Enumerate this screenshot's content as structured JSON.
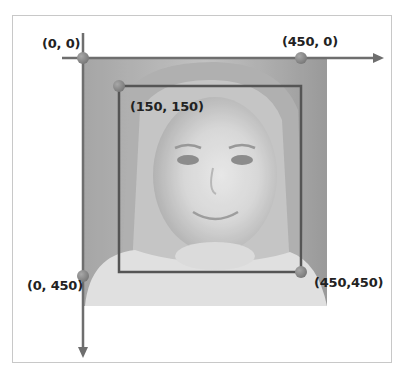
{
  "diagram": {
    "image": {
      "description": "grayscale photo of a smiling girl's face",
      "size": [
        450,
        450
      ]
    },
    "axes": {
      "x_direction": "right",
      "y_direction": "down",
      "color": "#6e6e6e"
    },
    "points": [
      {
        "id": "origin",
        "label": "(0, 0)"
      },
      {
        "id": "top-right",
        "label": "(450, 0)"
      },
      {
        "id": "bbox-top-left",
        "label": "(150, 150)"
      },
      {
        "id": "bottom-left",
        "label": "(0, 450)"
      },
      {
        "id": "bbox-bottom-right",
        "label": "(450,450)"
      }
    ],
    "bounding_box": {
      "top_left": [
        150,
        150
      ],
      "bottom_right": [
        450,
        450
      ],
      "color": "#555555"
    },
    "colors": {
      "point_fill": "#8a8a8a",
      "point_stroke": "#6a6a6a",
      "photo_tint": "#9c9c9c"
    }
  }
}
